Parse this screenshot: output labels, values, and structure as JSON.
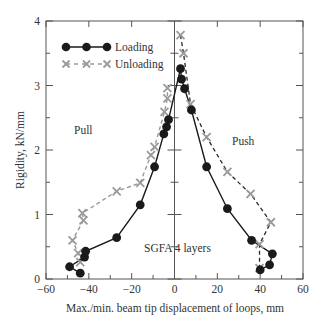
{
  "chart_data": {
    "type": "line",
    "title": "",
    "xlabel": "Max./min. beam tip displacement of loops, mm",
    "ylabel": "Rigidity, kN/mm",
    "xlim": [
      -60,
      60
    ],
    "ylim": [
      0,
      4
    ],
    "xticks": [
      -60,
      -40,
      -20,
      0,
      20,
      40,
      60
    ],
    "yticks": [
      0,
      1,
      2,
      3,
      4
    ],
    "xminor_step": 10,
    "yminor_step": 0.5,
    "grid": false,
    "legend_position": "upper left",
    "annotations": [
      {
        "text": "Pull",
        "x": -45,
        "y": 2.05
      },
      {
        "text": "Push",
        "x": 20,
        "y": 2.05
      },
      {
        "text": "SGFA 4 layers",
        "x": -16,
        "y": 0.45
      }
    ],
    "series": [
      {
        "name": "Loading",
        "style": "solid",
        "marker": "circle",
        "color": "#1a1a1a",
        "points": [
          [
            -44,
            0.09
          ],
          [
            -49,
            0.19
          ],
          [
            -42,
            0.34
          ],
          [
            -41.5,
            0.43
          ],
          [
            -27,
            0.64
          ],
          [
            -16,
            1.15
          ],
          [
            -9.3,
            1.74
          ],
          [
            -5,
            2.25
          ],
          [
            -3.7,
            2.36
          ],
          [
            -2.8,
            2.47
          ],
          [
            2.8,
            3.26
          ],
          [
            3.3,
            3.1
          ],
          [
            4.7,
            2.95
          ],
          [
            7.9,
            2.62
          ],
          [
            15,
            1.74
          ],
          [
            24.7,
            1.09
          ],
          [
            36,
            0.6
          ],
          [
            45.7,
            0.39
          ],
          [
            44.4,
            0.22
          ],
          [
            40,
            0.14
          ]
        ]
      },
      {
        "name": "Unloading",
        "style": "dashed",
        "marker": "x",
        "color": "#9a9a9a",
        "left_points": [
          [
            -44,
            0.26
          ],
          [
            -45,
            0.4
          ],
          [
            -47.6,
            0.6
          ],
          [
            -42.5,
            0.91
          ],
          [
            -43,
            1.02
          ],
          [
            -27,
            1.36
          ],
          [
            -16,
            1.49
          ],
          [
            -11,
            1.92
          ],
          [
            -9.3,
            2.05
          ],
          [
            -4.7,
            2.59
          ],
          [
            -3.3,
            2.8
          ],
          [
            -3.3,
            2.96
          ]
        ],
        "right_points": [
          [
            2.8,
            3.78
          ],
          [
            4.2,
            3.5
          ],
          [
            7.5,
            2.71
          ],
          [
            15,
            2.2
          ],
          [
            24.7,
            1.66
          ],
          [
            35.5,
            1.32
          ],
          [
            45,
            0.88
          ],
          [
            39.7,
            0.54
          ],
          [
            39.7,
            0.17
          ]
        ]
      }
    ]
  },
  "legend": {
    "items": [
      {
        "label": "Loading"
      },
      {
        "label": "Unloading"
      }
    ]
  },
  "labels": {
    "pull": "Pull",
    "push": "Push",
    "specimen": "SGFA 4 layers",
    "xlabel": "Max./min. beam tip displacement of loops, mm",
    "ylabel": "Rigidity, kN/mm"
  }
}
